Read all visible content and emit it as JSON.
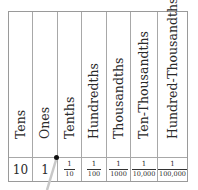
{
  "place_value_table": {
    "columns": [
      {
        "header": "Tens",
        "value": "10",
        "type": "whole"
      },
      {
        "header": "Ones",
        "value": "1",
        "type": "whole"
      },
      {
        "header": "Tenths",
        "numerator": "1",
        "denominator": "10",
        "type": "fraction"
      },
      {
        "header": "Hundredths",
        "numerator": "1",
        "denominator": "100",
        "type": "fraction"
      },
      {
        "header": "Thousandths",
        "numerator": "1",
        "denominator": "1000",
        "type": "fraction"
      },
      {
        "header": "Ten-Thousandths",
        "numerator": "1",
        "denominator": "10,000",
        "type": "fraction"
      },
      {
        "header": "Hundred-Thousandths",
        "numerator": "1",
        "denominator": "100,000",
        "type": "fraction"
      }
    ],
    "decimal_point_marker": "•",
    "colors": {
      "border": "#9a9a9a",
      "text": "#2a2a2a",
      "pointer": "#c8c8c8",
      "dot": "#111111"
    }
  }
}
